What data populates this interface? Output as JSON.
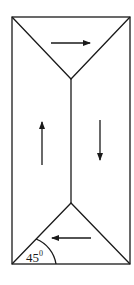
{
  "diagram": {
    "type": "flow-pattern",
    "shape": "rectangle divided by two triangles and a central vertical line",
    "angle_label": {
      "value": "45",
      "superscript": "0"
    },
    "arrows": [
      {
        "name": "top-arrow",
        "direction": "right"
      },
      {
        "name": "left-arrow",
        "direction": "up"
      },
      {
        "name": "right-arrow",
        "direction": "down"
      },
      {
        "name": "bottom-arrow",
        "direction": "left"
      }
    ],
    "colors": {
      "stroke": "#1a1a1a",
      "background": "#ffffff"
    }
  }
}
